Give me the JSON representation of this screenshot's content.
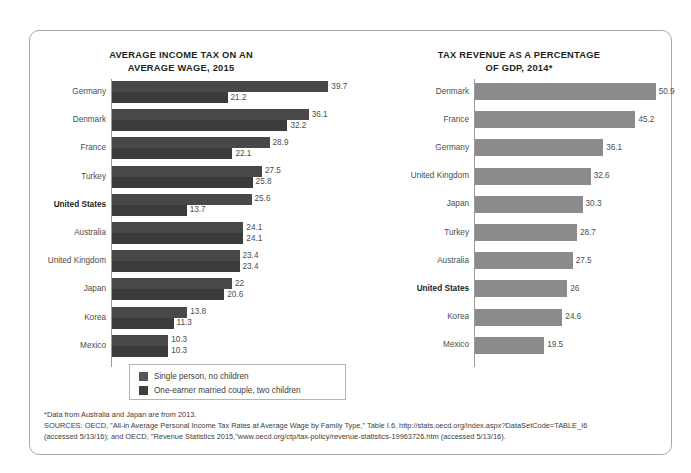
{
  "chart_data": [
    {
      "type": "bar",
      "orientation": "horizontal",
      "title": "AVERAGE INCOME TAX ON AN AVERAGE WAGE, 2015",
      "title_lines": [
        "AVERAGE INCOME TAX ON AN",
        "AVERAGE WAGE, 2015"
      ],
      "xlabel": "",
      "ylabel": "",
      "xlim": [
        0,
        39.7
      ],
      "grid": false,
      "legend_position": "bottom",
      "highlight_category": "United States",
      "categories": [
        "Germany",
        "Denmark",
        "France",
        "Turkey",
        "United States",
        "Australia",
        "United Kingdom",
        "Japan",
        "Korea",
        "Mexico"
      ],
      "series": [
        {
          "name": "Single person, no children",
          "color": "#484848",
          "values": [
            39.7,
            36.1,
            28.9,
            27.5,
            25.6,
            24.1,
            23.4,
            22,
            13.8,
            10.3
          ],
          "labels": [
            "39.7",
            "36.1",
            "28.9",
            "27.5",
            "25.6",
            "24.1",
            "23.4",
            "22",
            "13.8",
            "10.3"
          ]
        },
        {
          "name": "One-earner married couple, two children",
          "color": "#3b3b3b",
          "values": [
            21.2,
            32.2,
            22.1,
            25.8,
            13.7,
            24.1,
            23.4,
            20.6,
            11.3,
            10.3
          ],
          "labels": [
            "21.2",
            "32.2",
            "22.1",
            "25.8",
            "13.7",
            "24.1",
            "23.4",
            "20.6",
            "11.3",
            "10.3"
          ]
        }
      ]
    },
    {
      "type": "bar",
      "orientation": "horizontal",
      "title": "TAX REVENUE AS A PERCENTAGE OF GDP, 2014*",
      "title_lines": [
        "TAX REVENUE AS A PERCENTAGE",
        "OF GDP, 2014*"
      ],
      "xlabel": "",
      "ylabel": "",
      "xlim": [
        0,
        50.9
      ],
      "grid": false,
      "legend_position": "none",
      "highlight_category": "United States",
      "categories": [
        "Denmark",
        "France",
        "Germany",
        "United Kingdom",
        "Japan",
        "Turkey",
        "Australia",
        "United States",
        "Korea",
        "Mexico"
      ],
      "series": [
        {
          "name": "Tax revenue as a percentage of GDP",
          "color": "#8b8b8b",
          "values": [
            50.9,
            45.2,
            36.1,
            32.6,
            30.3,
            28.7,
            27.5,
            26,
            24.6,
            19.5
          ],
          "labels": [
            "50.9",
            "45.2",
            "36.1",
            "32.6",
            "30.3",
            "28.7",
            "27.5",
            "26",
            "24.6",
            "19.5"
          ]
        }
      ]
    }
  ],
  "legend": {
    "items": [
      {
        "label": "Single person, no children",
        "color": "#565656"
      },
      {
        "label": "One-earner married couple, two children",
        "color": "#3f3f3f"
      }
    ]
  },
  "notes": {
    "footnote": "*Data from Australia and Japan are from 2013.",
    "sources_line1": "SOURCES: OECD, \"All-in Average Personal Income Tax Rates at Average Wage by Family Type,\" Table I.6, http://stats.oecd.org/index.aspx?DataSetCode=TABLE_I6",
    "sources_line2": "(accessed 5/13/16); and OECD, \"Revenue Statistics 2015,\"www.oecd.org/ctp/tax-policy/revenue-statistics-19963726.htm (accessed 5/13/16)."
  }
}
